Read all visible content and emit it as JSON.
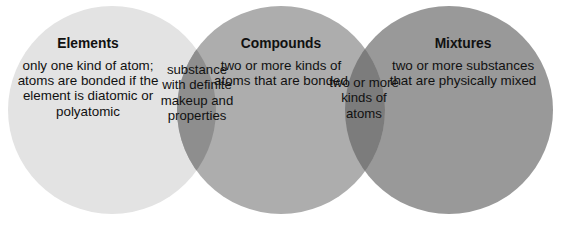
{
  "diagram": {
    "type": "venn-3-set-linear",
    "width": 563,
    "height": 229,
    "background_color": "#ffffff",
    "text_color": "#111111",
    "circles": [
      {
        "id": "elements",
        "label": "Elements",
        "cx": 112,
        "cy": 110,
        "r": 104,
        "fill": "#e3e3e3"
      },
      {
        "id": "compounds",
        "label": "Compounds",
        "cx": 281,
        "cy": 110,
        "r": 104,
        "fill": "#adadad"
      },
      {
        "id": "mixtures",
        "label": "Mixtures",
        "cx": 449,
        "cy": 110,
        "r": 104,
        "fill": "#999999"
      }
    ],
    "overlaps": [
      {
        "id": "elements-compounds",
        "sets": "Elements ∩ Compounds",
        "fill": "#8e8e8e"
      },
      {
        "id": "compounds-mixtures",
        "sets": "Compounds ∩ Mixtures",
        "fill": "#7c7c7c"
      }
    ]
  },
  "regions": {
    "elements": {
      "heading": "Elements",
      "body": "only one kind of atom; atoms are bonded if the element is diatomic or polyatomic",
      "lines": [
        "only one kind",
        "of atom; atoms",
        "are bonded if",
        "the element",
        "is diatomic or",
        "polyatomic"
      ]
    },
    "compounds": {
      "heading": "Compounds",
      "body": "two or more kinds of atoms that are bonded",
      "lines": [
        "two or",
        "more kinds",
        "of atoms",
        "that are",
        "bonded"
      ]
    },
    "mixtures": {
      "heading": "Mixtures",
      "body": "two or more substances that are physically mixed",
      "lines": [
        "two or more",
        "substances",
        "that are",
        "physically",
        "mixed"
      ]
    },
    "overlap_left": {
      "body": "substance with definite makeup and properties",
      "lines": [
        "substance",
        "with",
        "definite",
        "makeup",
        "and",
        "properties"
      ]
    },
    "overlap_right": {
      "body": "two or more kinds of atoms",
      "lines": [
        "two or",
        "more",
        "kinds of",
        "atoms"
      ]
    }
  }
}
